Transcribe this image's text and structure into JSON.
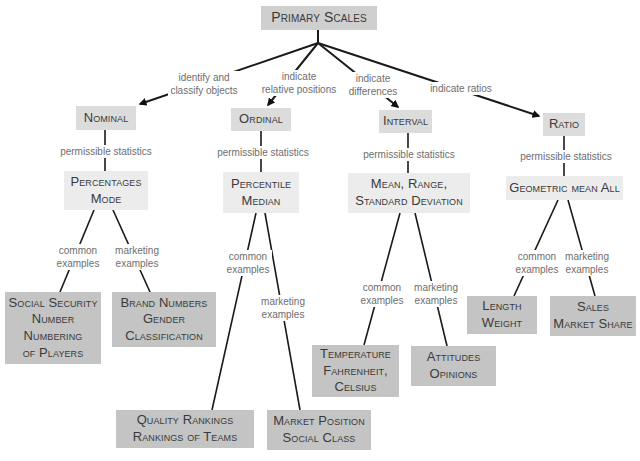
{
  "root": {
    "label": "Primary Scales"
  },
  "scales": [
    {
      "name": "Nominal",
      "relation": "identify and\nclassify objects",
      "stats_label": "permissible statistics",
      "stats": "Percentages\nMode",
      "common_label": "common\nexamples",
      "common": "Social Security\nNumber\nNumbering\nof Players",
      "marketing_label": "marketing\nexamples",
      "marketing": "Brand Numbers\nGender\nClassification"
    },
    {
      "name": "Ordinal",
      "relation": "indicate\nrelative positions",
      "stats_label": "permissible statistics",
      "stats": "Percentile\nMedian",
      "common_label": "common\nexamples",
      "common": "Quality Rankings\nRankings of Teams",
      "marketing_label": "marketing\nexamples",
      "marketing": "Market Position\nSocial Class"
    },
    {
      "name": "Interval",
      "relation": "indicate\ndifferences",
      "stats_label": "permissible statistics",
      "stats": "Mean, Range,\nStandard Deviation",
      "common_label": "common\nexamples",
      "common": "Temperature\nFahrenheit,\nCelsius",
      "marketing_label": "marketing\nexamples",
      "marketing": "Attitudes\nOpinions"
    },
    {
      "name": "Ratio",
      "relation": "indicate ratios",
      "stats_label": "permissible statistics",
      "stats": "Geometric mean All",
      "common_label": "common\nexamples",
      "common": "Length\nWeight",
      "marketing_label": "marketing\nexamples",
      "marketing": "Sales\nMarket Share"
    }
  ],
  "colors": {
    "root_box": "#cfcfcf",
    "scale_box": "#dcdcdc",
    "stats_box": "#ececec",
    "example_box": "#c4c4c4",
    "line": "#1a1a1a",
    "link_text": "#6e6e6e",
    "node_text": "#3a3a3a"
  }
}
